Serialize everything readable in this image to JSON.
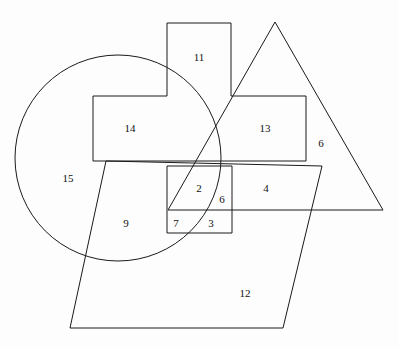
{
  "figure": {
    "canvas": {
      "width": 399,
      "height": 349
    },
    "background_color": "#fdfdfd",
    "stroke_color": "#1a1a1a",
    "stroke_width": 1,
    "label_color": "#111111"
  },
  "shapes": [
    {
      "id": "circle",
      "name": "circle",
      "type": "circle",
      "cx": 118,
      "cy": 158,
      "r": 103
    },
    {
      "id": "cross",
      "name": "cross-polygon",
      "type": "polygon",
      "points": "167,23 231,23 231,96 306,96 306,161 93,161 93,96 167,96"
    },
    {
      "id": "triangle",
      "name": "triangle",
      "type": "polygon",
      "points": "275,22 383,210 168,210"
    },
    {
      "id": "small-rectangle",
      "name": "small-rectangle",
      "type": "polygon",
      "points": "167,166 232,166 232,233 167,233"
    },
    {
      "id": "parallelogram",
      "name": "parallelogram",
      "type": "polygon",
      "points": "106,161 322,166 283,328 70,328"
    }
  ],
  "labels": [
    {
      "id": "label-11",
      "text": "11",
      "x": 199,
      "y": 57
    },
    {
      "id": "label-14",
      "text": "14",
      "x": 130,
      "y": 128
    },
    {
      "id": "label-13",
      "text": "13",
      "x": 265,
      "y": 128
    },
    {
      "id": "label-6-right",
      "text": "6",
      "x": 321,
      "y": 143
    },
    {
      "id": "label-15",
      "text": "15",
      "x": 68,
      "y": 178
    },
    {
      "id": "label-2",
      "text": "2",
      "x": 199,
      "y": 188
    },
    {
      "id": "label-6-inner",
      "text": "6",
      "x": 222,
      "y": 199
    },
    {
      "id": "label-4",
      "text": "4",
      "x": 266,
      "y": 188
    },
    {
      "id": "label-9",
      "text": "9",
      "x": 126,
      "y": 223
    },
    {
      "id": "label-7",
      "text": "7",
      "x": 176,
      "y": 223
    },
    {
      "id": "label-3",
      "text": "3",
      "x": 211,
      "y": 223
    },
    {
      "id": "label-12",
      "text": "12",
      "x": 245,
      "y": 293
    }
  ],
  "chart_data": {
    "type": "diagram",
    "shape_count": 5,
    "shape_types": [
      "circle",
      "cross-polygon",
      "triangle",
      "rectangle",
      "parallelogram"
    ],
    "region_numbers": [
      11,
      14,
      13,
      6,
      15,
      2,
      6,
      4,
      9,
      7,
      3,
      12
    ],
    "region_count": 12
  }
}
